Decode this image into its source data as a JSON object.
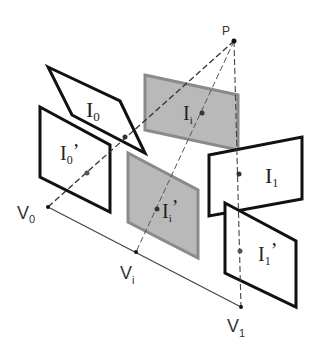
{
  "diagram": {
    "type": "view-interpolation-geometry",
    "point": {
      "label": "P",
      "x": 234,
      "y": 41
    },
    "camera_centers": [
      {
        "id": "V0",
        "label": "V",
        "sub": "0",
        "x": 48,
        "y": 207
      },
      {
        "id": "Vi",
        "label": "V",
        "sub": "i",
        "x": 136,
        "y": 252
      },
      {
        "id": "V1",
        "label": "V",
        "sub": "1",
        "x": 241,
        "y": 307
      }
    ],
    "planes": [
      {
        "id": "I0",
        "label": "I",
        "sub": "0",
        "prime": "",
        "fill": "#ffffff",
        "stroke": "#111111",
        "points": "48,67 120,101 145,153 72,115"
      },
      {
        "id": "I0p",
        "label": "I",
        "sub": "0",
        "prime": "’",
        "fill": "#ffffff",
        "stroke": "#111111",
        "points": "40,107 110,145 110,212 40,177"
      },
      {
        "id": "Ii",
        "label": "I",
        "sub": "i",
        "prime": "",
        "fill": "#b8b8b8",
        "stroke": "#888888",
        "points": "145,75 238,95 238,150 145,130"
      },
      {
        "id": "Iip",
        "label": "I",
        "sub": "i",
        "prime": "’",
        "fill": "#b8b8b8",
        "stroke": "#888888",
        "points": "128,153 198,190 198,258 128,222"
      },
      {
        "id": "I1",
        "label": "I",
        "sub": "1",
        "prime": "",
        "fill": "#ffffff",
        "stroke": "#111111",
        "points": "209,155 302,137 302,199 209,216"
      },
      {
        "id": "I1p",
        "label": "I",
        "sub": "1",
        "prime": "’",
        "fill": "#ffffff",
        "stroke": "#111111",
        "points": "225,203 296,241 296,307 225,273"
      }
    ],
    "colors": {
      "outline": "#111111",
      "gray_fill": "#b8b8b8",
      "gray_stroke": "#888888",
      "ray": "#444444"
    }
  }
}
